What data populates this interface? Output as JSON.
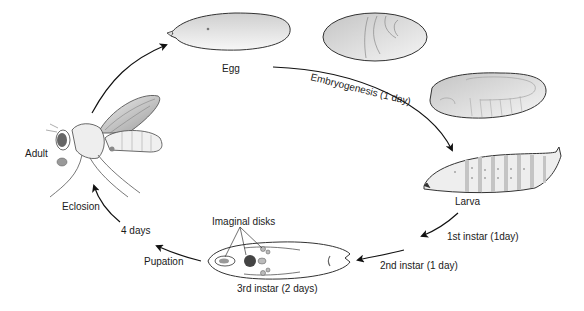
{
  "diagram": {
    "type": "life-cycle",
    "stages": [
      {
        "id": "egg",
        "label": "Egg"
      },
      {
        "id": "larva",
        "label": "Larva"
      },
      {
        "id": "third-instar",
        "label": "3rd instar (2 days)"
      },
      {
        "id": "adult",
        "label": "Adult"
      }
    ],
    "transitions": [
      {
        "id": "embryogenesis",
        "label": "Embryogenesis (1 day)"
      },
      {
        "id": "first-instar",
        "label": "1st instar (1day)"
      },
      {
        "id": "second-instar",
        "label": "2nd instar (1 day)"
      },
      {
        "id": "pupation",
        "label": "Pupation"
      },
      {
        "id": "four-days",
        "label": "4 days"
      },
      {
        "id": "eclosion",
        "label": "Eclosion"
      }
    ],
    "annotations": {
      "imaginal_disks": "Imaginal disks"
    },
    "colors": {
      "outline": "#333333",
      "fill_light": "#f2f2f2",
      "fill_dark": "#bdbdbd",
      "arrow": "#111111"
    }
  }
}
